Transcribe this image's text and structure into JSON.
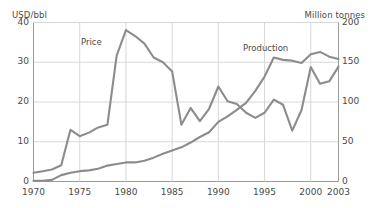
{
  "chart_data": {
    "type": "line",
    "title": "",
    "xlabel": "",
    "grid": true,
    "legend_position": "inline-annotations",
    "x": [
      1970,
      1971,
      1972,
      1973,
      1974,
      1975,
      1976,
      1977,
      1978,
      1979,
      1980,
      1981,
      1982,
      1983,
      1984,
      1985,
      1986,
      1987,
      1988,
      1989,
      1990,
      1991,
      1992,
      1993,
      1994,
      1995,
      1996,
      1997,
      1998,
      1999,
      2000,
      2001,
      2002,
      2003
    ],
    "axes": {
      "left": {
        "label": "USD/bbl",
        "ticks": [
          0,
          10,
          20,
          30,
          40
        ],
        "ylim": [
          0,
          40
        ]
      },
      "right": {
        "label": "Million tonnes",
        "ticks": [
          0,
          50,
          100,
          150,
          200
        ],
        "ylim": [
          0,
          200
        ]
      },
      "x": {
        "ticks": [
          1970,
          1975,
          1980,
          1985,
          1990,
          1995,
          2000,
          2003
        ],
        "xlim": [
          1970,
          2003
        ]
      }
    },
    "series": [
      {
        "name": "Price",
        "axis": "left",
        "unit": "USD/bbl",
        "color": "#8c8c8c",
        "values": [
          2.2,
          2.6,
          3.0,
          4.1,
          13.0,
          11.4,
          12.3,
          13.6,
          14.3,
          31.7,
          38.1,
          36.6,
          34.7,
          31.2,
          30.0,
          27.7,
          14.3,
          18.5,
          15.2,
          18.3,
          23.9,
          20.2,
          19.5,
          17.3,
          16.0,
          17.3,
          20.6,
          19.3,
          12.8,
          18.0,
          28.8,
          24.6,
          25.2,
          28.9
        ],
        "annotation": "Price"
      },
      {
        "name": "Production",
        "axis": "right",
        "unit": "Million tonnes",
        "color": "#8c8c8c",
        "values": [
          1,
          1,
          2,
          8,
          11,
          13,
          14,
          16,
          20,
          22,
          24,
          24,
          26,
          30,
          35,
          39,
          43,
          49,
          56,
          62,
          75,
          82,
          90,
          99,
          114,
          132,
          156,
          153,
          152,
          149,
          160,
          163,
          157,
          154
        ],
        "annotation": "Production"
      }
    ]
  },
  "annotations": {
    "price": "Price",
    "production": "Production"
  }
}
